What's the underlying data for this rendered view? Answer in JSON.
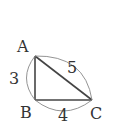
{
  "diagram": {
    "type": "right-triangle",
    "vertices": {
      "A": {
        "label": "A"
      },
      "B": {
        "label": "B"
      },
      "C": {
        "label": "C"
      }
    },
    "sides": {
      "AB": {
        "length_label": "3"
      },
      "BC": {
        "length_label": "4"
      },
      "AC": {
        "length_label": "5"
      }
    },
    "colors": {
      "stroke": "#444444",
      "arc": "#888888",
      "text": "#333333"
    }
  }
}
